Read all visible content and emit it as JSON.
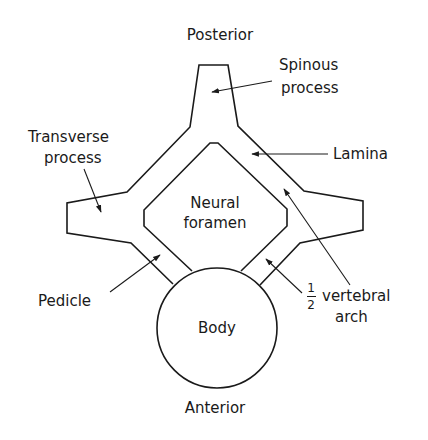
{
  "diagram": {
    "stroke_color": "#1a1a1a",
    "background": "#ffffff"
  },
  "labels": {
    "posterior": "Posterior",
    "anterior": "Anterior",
    "spinous_1": "Spinous",
    "spinous_2": "process",
    "transverse_1": "Transverse",
    "transverse_2": "process",
    "lamina": "Lamina",
    "neural_1": "Neural",
    "neural_2": "foramen",
    "pedicle": "Pedicle",
    "body": "Body",
    "half_num": "1",
    "half_den": "2",
    "vertebral": "vertebral",
    "arch": "arch"
  }
}
